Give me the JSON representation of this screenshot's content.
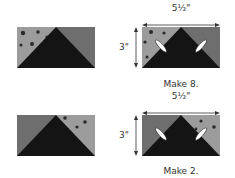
{
  "colors": {
    "background": "#ffffff",
    "light_fabric": "#9c9c9c",
    "medium_fabric": "#6e6e6e",
    "dark_fabric": "#141414",
    "dot": "#2a2a2a",
    "line": "#333333"
  },
  "rows": [
    {
      "unpieced_block": {
        "speckled_side": "left"
      },
      "finished_block": {
        "speckled_side": "left",
        "width_label": "5½\"",
        "height_label": "3\"",
        "stitch_marks": 2
      },
      "caption": "Make 8."
    },
    {
      "unpieced_block": {
        "speckled_side": "right"
      },
      "finished_block": {
        "speckled_side": "right",
        "width_label": "5½\"",
        "height_label": "3\"",
        "stitch_marks": 2
      },
      "caption": "Make 2."
    }
  ]
}
